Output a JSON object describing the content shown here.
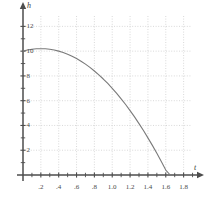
{
  "chart_data": {
    "type": "line",
    "title": "",
    "xlabel": "t",
    "ylabel": "h",
    "xlim": [
      0,
      1.95
    ],
    "ylim": [
      0,
      13
    ],
    "grid": true,
    "legend": null,
    "x_ticks": [
      0.2,
      0.4,
      0.6,
      0.8,
      1.0,
      1.2,
      1.4,
      1.6,
      1.8
    ],
    "x_tick_labels": [
      ".2",
      ".4",
      ".6",
      ".8",
      "1.0",
      "1.2",
      "1.4",
      "1.6",
      "1.8"
    ],
    "y_ticks": [
      2,
      4,
      6,
      8,
      10,
      12
    ],
    "y_tick_labels": [
      "2",
      "4",
      "6",
      "8",
      "10",
      "12"
    ],
    "x_minor_step": 0.1,
    "y_minor_step": 1,
    "curve_color": "#7a7a7a",
    "grid_color": "#c8c8c8",
    "axis_color": "#4d4d4d",
    "series": [
      {
        "name": "h(t)",
        "x": [
          0.0,
          0.05,
          0.1,
          0.15,
          0.2,
          0.25,
          0.3,
          0.35,
          0.4,
          0.45,
          0.5,
          0.55,
          0.6,
          0.65,
          0.7,
          0.75,
          0.8,
          0.85,
          0.9,
          0.95,
          1.0,
          1.05,
          1.1,
          1.15,
          1.2,
          1.25,
          1.3,
          1.35,
          1.4,
          1.45,
          1.5,
          1.55,
          1.6,
          1.65
        ],
        "y": [
          10.0,
          10.09,
          10.15,
          10.19,
          10.2,
          10.19,
          10.15,
          10.09,
          10.0,
          9.89,
          9.75,
          9.59,
          9.4,
          9.19,
          8.95,
          8.69,
          8.4,
          8.09,
          7.75,
          7.39,
          7.0,
          6.59,
          6.15,
          5.69,
          5.2,
          4.69,
          4.15,
          3.59,
          3.0,
          2.39,
          1.75,
          1.09,
          0.4,
          0.0
        ]
      }
    ],
    "annotations": []
  },
  "axis_labels": {
    "x_name": "t",
    "y_name": "h"
  }
}
